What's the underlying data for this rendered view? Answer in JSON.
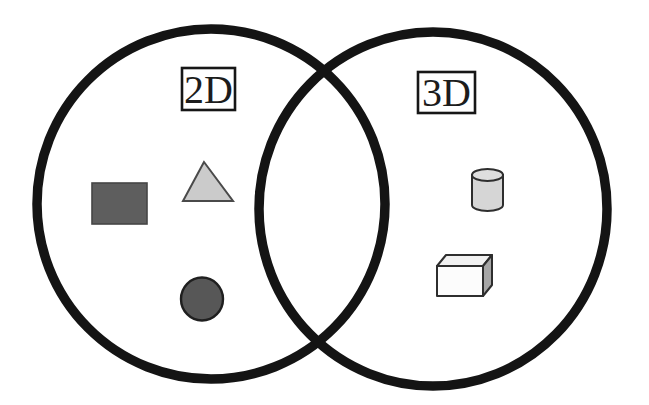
{
  "diagram": {
    "type": "venn",
    "background_color": "#ffffff",
    "circle_outline_color": "#141414",
    "left_set": {
      "label": "2D",
      "shapes": [
        {
          "name": "rectangle-icon",
          "fill": "#5e5e5e",
          "stroke": "#454545"
        },
        {
          "name": "triangle-icon",
          "fill": "#cbcbcb",
          "stroke": "#4a4a4a"
        },
        {
          "name": "circle-icon",
          "fill": "#575757",
          "stroke": "#1f1f1f"
        }
      ]
    },
    "right_set": {
      "label": "3D",
      "shapes": [
        {
          "name": "cylinder-icon",
          "fill": "#d6d6d6",
          "top_fill": "#dedede",
          "stroke": "#2e2e2e"
        },
        {
          "name": "cube-icon",
          "front_fill": "#fcfcfc",
          "top_fill": "#f1f1f1",
          "side_fill": "#a6a6a6",
          "stroke": "#2e2e2e"
        }
      ]
    },
    "label_box": {
      "fill": "#ffffff",
      "stroke": "#161616",
      "text_color": "#1c1c1c"
    }
  }
}
